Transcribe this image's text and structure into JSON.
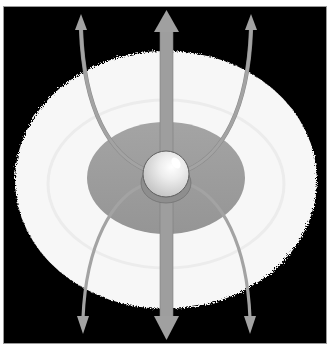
{
  "diagram": {
    "title": "Accretion disk with bipolar jets and magnetic field lines",
    "colors": {
      "frame_border": "#9a9a9a",
      "background": "#000000",
      "outer_disk": "#f7f7f7",
      "inner_disk": "#9c9c9c",
      "inner_disk_edge": "#7a7a7a",
      "central_body": "#e4e4e4",
      "jet": "#9e9e9e",
      "field_line": "#a3a3a3"
    },
    "elements": {
      "outer_disk": {
        "cx": 166,
        "cy": 180,
        "rx": 151,
        "ry": 129
      },
      "inner_disk": {
        "cx": 166,
        "cy": 178,
        "rx": 79,
        "ry": 56
      },
      "central_body": {
        "cx": 166,
        "cy": 174,
        "r": 23
      },
      "jet": {
        "x": 166,
        "y_top": 10,
        "y_bottom": 338,
        "width": 13
      }
    },
    "arrows": [
      {
        "id": "jet-up",
        "direction": "up"
      },
      {
        "id": "jet-down",
        "direction": "down"
      },
      {
        "id": "field-line-upper-left",
        "direction": "up"
      },
      {
        "id": "field-line-upper-right",
        "direction": "up"
      },
      {
        "id": "field-line-lower-left",
        "direction": "down"
      },
      {
        "id": "field-line-lower-right",
        "direction": "down"
      }
    ]
  }
}
